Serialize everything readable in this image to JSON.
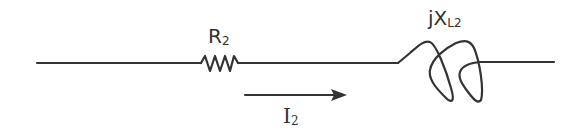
{
  "diagram": {
    "type": "series circuit segment",
    "stroke_color": "#333333",
    "background": "#ffffff",
    "components": [
      {
        "kind": "resistor",
        "label_main": "R",
        "label_sub": "2"
      },
      {
        "kind": "inductor",
        "label_main": "jX",
        "label_sub": "L2"
      }
    ],
    "current": {
      "label_main": "I",
      "label_sub": "2",
      "direction": "left-to-right"
    }
  }
}
